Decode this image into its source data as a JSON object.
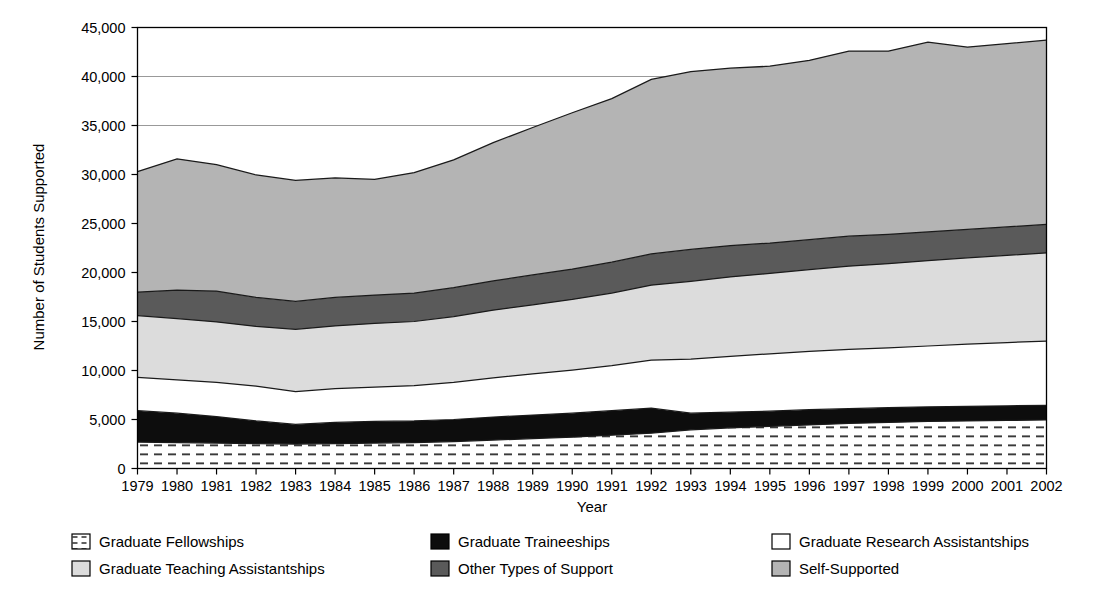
{
  "chart_data": {
    "type": "area",
    "stacked": true,
    "title": "",
    "xlabel": "Year",
    "ylabel": "Number of Students Supported",
    "x": [
      1979,
      1980,
      1981,
      1982,
      1983,
      1984,
      1985,
      1986,
      1987,
      1988,
      1989,
      1990,
      1991,
      1992,
      1993,
      1994,
      1995,
      1996,
      1997,
      1998,
      1999,
      2000,
      2001,
      2002
    ],
    "categories": [
      "1979",
      "1980",
      "1981",
      "1982",
      "1983",
      "1984",
      "1985",
      "1986",
      "1987",
      "1988",
      "1989",
      "1990",
      "1991",
      "1992",
      "1993",
      "1994",
      "1995",
      "1996",
      "1997",
      "1998",
      "1999",
      "2000",
      "2001",
      "2002"
    ],
    "xlim": [
      1979,
      2002
    ],
    "ylim": [
      0,
      45000
    ],
    "ytick_values": [
      0,
      5000,
      10000,
      15000,
      20000,
      25000,
      30000,
      35000,
      40000,
      45000
    ],
    "ytick_labels": [
      "0",
      "5,000",
      "10,000",
      "15,000",
      "20,000",
      "25,000",
      "30,000",
      "35,000",
      "40,000",
      "45,000"
    ],
    "grid": "horizontal-light",
    "legend_position": "bottom",
    "series": [
      {
        "name": "Graduate Fellowships",
        "pattern": "dashed-hatch",
        "color": "#ffffff",
        "values": [
          2700,
          2650,
          2600,
          2550,
          2500,
          2550,
          2600,
          2650,
          2750,
          2900,
          3050,
          3200,
          3400,
          3600,
          3950,
          4150,
          4300,
          4450,
          4600,
          4700,
          4800,
          4850,
          4900,
          4950
        ]
      },
      {
        "name": "Graduate Traineeships",
        "pattern": "solid",
        "color": "#0d0d0d",
        "values": [
          3200,
          3000,
          2700,
          2300,
          2000,
          2150,
          2200,
          2200,
          2250,
          2350,
          2400,
          2450,
          2500,
          2550,
          1700,
          1600,
          1550,
          1550,
          1500,
          1500,
          1500,
          1500,
          1500,
          1500
        ]
      },
      {
        "name": "Graduate Research Assistantships",
        "pattern": "solid",
        "color": "#ffffff",
        "values": [
          3400,
          3400,
          3500,
          3550,
          3350,
          3450,
          3500,
          3600,
          3800,
          4000,
          4200,
          4400,
          4600,
          4900,
          5500,
          5700,
          5850,
          5950,
          6050,
          6100,
          6200,
          6350,
          6450,
          6550
        ]
      },
      {
        "name": "Graduate Teaching Assistantships",
        "pattern": "solid",
        "color": "#dcdcdc",
        "values": [
          6300,
          6250,
          6150,
          6100,
          6350,
          6400,
          6500,
          6550,
          6700,
          6900,
          7050,
          7200,
          7400,
          7650,
          7950,
          8100,
          8200,
          8350,
          8500,
          8600,
          8700,
          8800,
          8900,
          9000
        ]
      },
      {
        "name": "Other Types of Support",
        "pattern": "solid",
        "color": "#5a5a5a",
        "values": [
          2400,
          2900,
          3150,
          2950,
          2850,
          2900,
          2900,
          2900,
          2950,
          3000,
          3050,
          3100,
          3150,
          3200,
          3250,
          3200,
          3100,
          3050,
          3050,
          3000,
          2950,
          2900,
          2900,
          2900
        ]
      },
      {
        "name": "Self-Supported",
        "pattern": "solid",
        "color": "#b4b4b4",
        "values": [
          12300,
          13400,
          12900,
          12500,
          12350,
          12200,
          11800,
          12300,
          13050,
          14100,
          15050,
          15950,
          16700,
          17800,
          18150,
          18100,
          18050,
          18300,
          18900,
          18700,
          19350,
          18600,
          18700,
          18800
        ]
      }
    ],
    "stack_order_bottom_to_top": [
      "Graduate Fellowships",
      "Graduate Traineeships",
      "Graduate Research Assistantships",
      "Graduate Teaching Assistantships",
      "Other Types of Support",
      "Self-Supported"
    ]
  },
  "legend": {
    "entries": [
      {
        "label": "Graduate Fellowships",
        "swatch": "dashed-hatch",
        "color": "#ffffff",
        "col": 0,
        "row": 0
      },
      {
        "label": "Graduate Traineeships",
        "swatch": "solid",
        "color": "#0d0d0d",
        "col": 1,
        "row": 0
      },
      {
        "label": "Graduate Research Assistantships",
        "swatch": "solid",
        "color": "#ffffff",
        "col": 2,
        "row": 0
      },
      {
        "label": "Graduate Teaching Assistantships",
        "swatch": "solid",
        "color": "#dcdcdc",
        "col": 0,
        "row": 1
      },
      {
        "label": "Other Types of Support",
        "swatch": "solid",
        "color": "#5a5a5a",
        "col": 1,
        "row": 1
      },
      {
        "label": "Self-Supported",
        "swatch": "solid",
        "color": "#b4b4b4",
        "col": 2,
        "row": 1
      }
    ]
  }
}
